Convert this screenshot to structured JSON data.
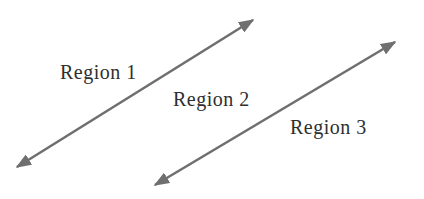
{
  "diagram": {
    "background_color": "#ffffff",
    "arrow_color": "#6f6f6f",
    "text_color": "#2f2f2f",
    "arrows": [
      {
        "name": "region-1-2-boundary-arrow",
        "x1": 17,
        "y1": 167,
        "x2": 253,
        "y2": 20
      },
      {
        "name": "region-2-3-boundary-arrow",
        "x1": 155,
        "y1": 185,
        "x2": 395,
        "y2": 42
      }
    ],
    "labels": [
      {
        "name": "region-1-label",
        "text": "Region 1",
        "x": 60,
        "y": 62
      },
      {
        "name": "region-2-label",
        "text": "Region 2",
        "x": 173,
        "y": 89
      },
      {
        "name": "region-3-label",
        "text": "Region 3",
        "x": 290,
        "y": 117
      }
    ]
  }
}
